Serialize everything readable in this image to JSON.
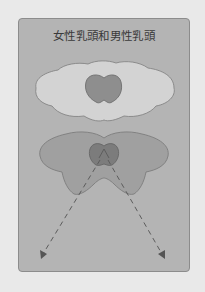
{
  "diagram": {
    "title": "女性乳頭和男性乳頭",
    "panels": [
      {
        "name": "female-nipple",
        "areola_color": "#d2d2d2",
        "nipple_color": "#8f8f8f"
      },
      {
        "name": "male-nipple",
        "areola_color": "#9f9f9f",
        "nipple_color": "#7a7a7a",
        "arrows": [
          "lower-left",
          "lower-right"
        ]
      }
    ]
  },
  "colors": {
    "background": "#e9e9e9",
    "card": "#b4b4b4",
    "card_border": "#8c8c8c",
    "outline": "#7d7d7d",
    "arrow": "#5c5c5c"
  }
}
